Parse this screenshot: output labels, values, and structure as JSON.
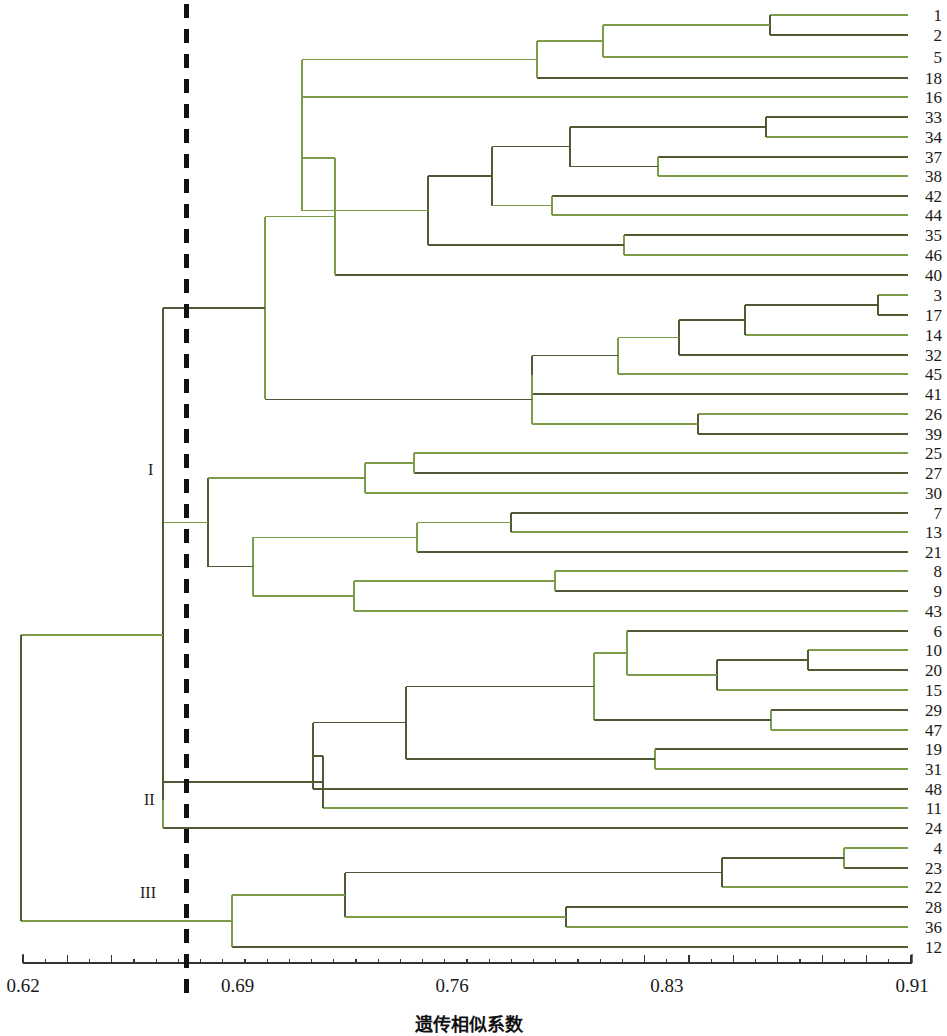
{
  "chart_data": {
    "type": "dendrogram",
    "title": "",
    "xlabel": "遗传相似系数",
    "ylabel": "",
    "xlim": [
      0.62,
      0.91
    ],
    "grid": false,
    "legend": "none",
    "axis": {
      "tick_labels": [
        "0.62",
        "0.69",
        "0.76",
        "0.83",
        "0.91"
      ],
      "tick_values": [
        0.62,
        0.69,
        0.76,
        0.83,
        0.91
      ],
      "minor_ticks": true
    },
    "cut_line": {
      "value": 0.6725,
      "style": "dashed",
      "color": "#111111"
    },
    "group_labels": [
      {
        "name": "I",
        "text": "I",
        "x_px": 148,
        "y_px": 470
      },
      {
        "name": "II",
        "text": "II",
        "x_px": 144,
        "y_px": 800
      },
      {
        "name": "III",
        "text": "III",
        "x_px": 140,
        "y_px": 893
      }
    ],
    "colors": {
      "line_dark": "#4f5a35",
      "line_light": "#7d9c4a",
      "axis": "#333333",
      "cut": "#111111"
    },
    "leaf_order": [
      "1",
      "2",
      "5",
      "18",
      "16",
      "33",
      "34",
      "37",
      "38",
      "42",
      "44",
      "35",
      "46",
      "40",
      "3",
      "17",
      "14",
      "32",
      "45",
      "41",
      "26",
      "39",
      "25",
      "27",
      "30",
      "7",
      "13",
      "21",
      "8",
      "9",
      "43",
      "6",
      "10",
      "20",
      "15",
      "29",
      "47",
      "19",
      "31",
      "48",
      "11",
      "24",
      "4",
      "23",
      "22",
      "28",
      "36",
      "12"
    ],
    "leaf_count": 48,
    "leaf_y_px": [
      15,
      35,
      57,
      78,
      97,
      117,
      137,
      157,
      176,
      196,
      215,
      235,
      255,
      275,
      295,
      315,
      335,
      355,
      374,
      394,
      414,
      434,
      453,
      473,
      493,
      513,
      532,
      552,
      571,
      591,
      611,
      631,
      650,
      670,
      690,
      710,
      730,
      749,
      769,
      789,
      808,
      828,
      848,
      868,
      887,
      907,
      927,
      947
    ],
    "nodes": [
      {
        "id": "n1_2",
        "x_px": 770,
        "children": [
          "1",
          "2"
        ]
      },
      {
        "id": "n1_2_5",
        "x_px": 603,
        "children": [
          "n1_2",
          "5"
        ]
      },
      {
        "id": "n1_2_5_18",
        "x_px": 537,
        "children": [
          "n1_2_5",
          "18"
        ]
      },
      {
        "id": "n33_34",
        "x_px": 766,
        "children": [
          "33",
          "34"
        ]
      },
      {
        "id": "n37_38",
        "x_px": 658,
        "children": [
          "37",
          "38"
        ]
      },
      {
        "id": "n33_38",
        "x_px": 570,
        "children": [
          "n33_34",
          "n37_38"
        ]
      },
      {
        "id": "n42_44",
        "x_px": 552,
        "children": [
          "42",
          "44"
        ]
      },
      {
        "id": "n33_44",
        "x_px": 492,
        "children": [
          "n33_38",
          "n42_44"
        ]
      },
      {
        "id": "n35_46",
        "x_px": 624,
        "children": [
          "35",
          "46"
        ]
      },
      {
        "id": "n33_46",
        "x_px": 428,
        "children": [
          "n33_44",
          "n35_46"
        ]
      },
      {
        "id": "nA",
        "x_px": 302,
        "children": [
          "n1_2_5_18",
          "16",
          "n33_46"
        ]
      },
      {
        "id": "nA40",
        "x_px": 335,
        "children": [
          "nA",
          "40"
        ]
      },
      {
        "id": "n3_17",
        "x_px": 878,
        "children": [
          "3",
          "17"
        ]
      },
      {
        "id": "n3_14",
        "x_px": 745,
        "children": [
          "n3_17",
          "14"
        ]
      },
      {
        "id": "n3_32",
        "x_px": 679,
        "children": [
          "n3_14",
          "32"
        ]
      },
      {
        "id": "n3_45",
        "x_px": 618,
        "children": [
          "n3_32",
          "45"
        ]
      },
      {
        "id": "n3_41",
        "x_px": 532,
        "children": [
          "n3_45",
          "41"
        ]
      },
      {
        "id": "n26_39",
        "x_px": 698,
        "children": [
          "26",
          "39"
        ]
      },
      {
        "id": "nB",
        "x_px": 532,
        "children": [
          "n3_41",
          "n26_39"
        ]
      },
      {
        "id": "nTop",
        "x_px": 265,
        "children": [
          "nA40",
          "nB"
        ]
      },
      {
        "id": "n25_27",
        "x_px": 414,
        "children": [
          "25",
          "27"
        ]
      },
      {
        "id": "n25_30",
        "x_px": 365,
        "children": [
          "n25_27",
          "30"
        ]
      },
      {
        "id": "n7_13",
        "x_px": 511,
        "children": [
          "7",
          "13"
        ]
      },
      {
        "id": "n7_21",
        "x_px": 417,
        "children": [
          "n7_13",
          "21"
        ]
      },
      {
        "id": "n8_9",
        "x_px": 555,
        "children": [
          "8",
          "9"
        ]
      },
      {
        "id": "n8_43",
        "x_px": 354,
        "children": [
          "n8_9",
          "43"
        ]
      },
      {
        "id": "nC",
        "x_px": 253,
        "children": [
          "n7_21",
          "n8_43"
        ]
      },
      {
        "id": "nD",
        "x_px": 208,
        "children": [
          "n25_30",
          "nC"
        ]
      },
      {
        "id": "nI",
        "x_px": 163,
        "children": [
          "nTop",
          "nD"
        ]
      },
      {
        "id": "n10_20",
        "x_px": 808,
        "children": [
          "10",
          "20"
        ]
      },
      {
        "id": "n10_15",
        "x_px": 717,
        "children": [
          "n10_20",
          "15"
        ]
      },
      {
        "id": "n6_15",
        "x_px": 627,
        "children": [
          "6",
          "n10_15"
        ]
      },
      {
        "id": "n29_47",
        "x_px": 771,
        "children": [
          "29",
          "47"
        ]
      },
      {
        "id": "nE",
        "x_px": 594,
        "children": [
          "n6_15",
          "n29_47"
        ]
      },
      {
        "id": "n19_31",
        "x_px": 655,
        "children": [
          "19",
          "31"
        ]
      },
      {
        "id": "nF",
        "x_px": 406,
        "children": [
          "nE",
          "n19_31"
        ]
      },
      {
        "id": "nG",
        "x_px": 313,
        "children": [
          "nF",
          "48"
        ]
      },
      {
        "id": "nH",
        "x_px": 323,
        "children": [
          "nG",
          "11"
        ]
      },
      {
        "id": "nII",
        "x_px": 163,
        "children": [
          "nH",
          "24"
        ]
      },
      {
        "id": "n4_23",
        "x_px": 844,
        "children": [
          "4",
          "23"
        ]
      },
      {
        "id": "n4_22",
        "x_px": 722,
        "children": [
          "n4_23",
          "22"
        ]
      },
      {
        "id": "n28_36",
        "x_px": 566,
        "children": [
          "28",
          "36"
        ]
      },
      {
        "id": "nJ",
        "x_px": 345,
        "children": [
          "n4_22",
          "n28_36"
        ]
      },
      {
        "id": "nIII",
        "x_px": 232,
        "children": [
          "nJ",
          "12"
        ]
      },
      {
        "id": "nRoot",
        "x_px": 21,
        "children": [
          "nI_II",
          "nIII"
        ]
      }
    ]
  }
}
